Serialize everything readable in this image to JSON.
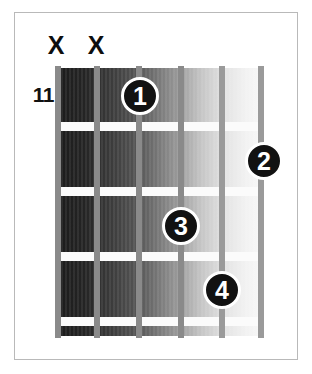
{
  "diagram": {
    "type": "guitar-chord-diagram",
    "starting_fret_label": "11",
    "num_strings": 6,
    "num_frets": 4,
    "background_color": "#ffffff",
    "frame_color": "#b9b9b9",
    "string_color": "#8a8a8a",
    "fret_color": "#fbfbfb",
    "dot_color": "#121212",
    "dot_text_color": "#ffffff",
    "marker_color": "#0e0e0e"
  },
  "string_markers": [
    {
      "label": "X",
      "name": "mute-marker-string-6",
      "left": 45
    },
    {
      "label": "X",
      "name": "mute-marker-string-5",
      "left": 85
    }
  ],
  "strings": [
    {
      "index": 1,
      "name": "string-6",
      "left": 0,
      "shade": "dark"
    },
    {
      "index": 2,
      "name": "string-5",
      "left": 39,
      "shade": "dark"
    },
    {
      "index": 3,
      "name": "string-4",
      "left": 81,
      "shade": "dark"
    },
    {
      "index": 4,
      "name": "string-3",
      "left": 123,
      "shade": "dark"
    },
    {
      "index": 5,
      "name": "string-2",
      "left": 164,
      "shade": "light"
    },
    {
      "index": 6,
      "name": "string-1",
      "left": 203,
      "shade": "light"
    }
  ],
  "frets": [
    {
      "index": 1,
      "name": "fret-line-1",
      "top": 54
    },
    {
      "index": 2,
      "name": "fret-line-2",
      "top": 119
    },
    {
      "index": 3,
      "name": "fret-line-3",
      "top": 184
    },
    {
      "index": 4,
      "name": "fret-line-4",
      "top": 249
    }
  ],
  "finger_dots": [
    {
      "label": "1",
      "name": "finger-dot-1",
      "left": 121,
      "top": 77,
      "string": 4,
      "fret": 1
    },
    {
      "label": "2",
      "name": "finger-dot-2",
      "left": 245,
      "top": 142,
      "string": 1,
      "fret": 2
    },
    {
      "label": "3",
      "name": "finger-dot-3",
      "left": 162,
      "top": 207,
      "string": 3,
      "fret": 3
    },
    {
      "label": "4",
      "name": "finger-dot-4",
      "left": 203,
      "top": 271,
      "string": 2,
      "fret": 4
    }
  ]
}
